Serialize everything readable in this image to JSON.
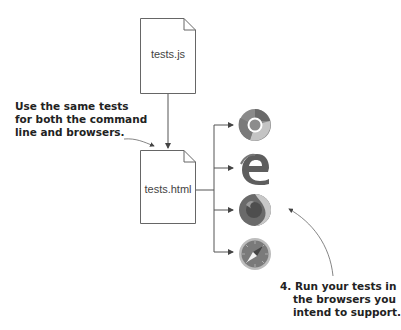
{
  "files": {
    "source": {
      "label": "tests.js"
    },
    "runner": {
      "label": "tests.html"
    }
  },
  "annotations": {
    "left": {
      "lines": [
        "Use the same tests",
        "for both the command",
        "line and browsers."
      ]
    },
    "right": {
      "lines": [
        "4. Run your tests in",
        "the browsers you",
        "intend to support."
      ]
    }
  },
  "browsers": [
    {
      "name": "Chrome",
      "icon": "chrome-icon"
    },
    {
      "name": "Edge",
      "icon": "edge-icon"
    },
    {
      "name": "Firefox",
      "icon": "firefox-icon"
    },
    {
      "name": "Safari",
      "icon": "safari-icon"
    }
  ],
  "colors": {
    "line": "#555555",
    "file_border": "#666666",
    "icon_dark": "#5a5a5a",
    "icon_mid": "#8a8a8a",
    "icon_light": "#c8c8c8"
  }
}
